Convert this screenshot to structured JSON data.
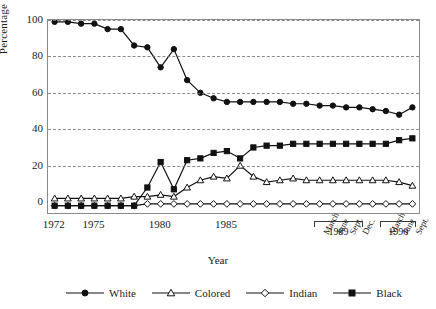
{
  "chart_data": {
    "type": "line",
    "title": "",
    "xlabel": "Year",
    "ylabel": "Percentage",
    "ylim": [
      0,
      100
    ],
    "ytick_values": [
      0,
      20,
      40,
      60,
      80,
      100
    ],
    "ytick_labels": [
      "0",
      "20",
      "40",
      "60",
      "80",
      "100"
    ],
    "grid": true,
    "grid_style": "dashed-horizontal",
    "legend_position": "bottom",
    "x_major_ticks": [
      {
        "label": "1972",
        "index": 0
      },
      {
        "label": "1975",
        "index": 3
      },
      {
        "label": "1980",
        "index": 8
      },
      {
        "label": "1985",
        "index": 13
      }
    ],
    "x_quarter_ticks": [
      {
        "label": "March",
        "index": 20
      },
      {
        "label": "June",
        "index": 21
      },
      {
        "label": "Sept.",
        "index": 22
      },
      {
        "label": "Dec.",
        "index": 23
      },
      {
        "label": "March",
        "index": 25
      },
      {
        "label": "June",
        "index": 26
      },
      {
        "label": "Sept.",
        "index": 27
      }
    ],
    "x_group_brackets": [
      {
        "label": "1989",
        "start_index": 20,
        "end_index": 23
      },
      {
        "label": "1990",
        "start_index": 25,
        "end_index": 27
      }
    ],
    "x": [
      "1972",
      "1973",
      "1974",
      "1975",
      "1976",
      "1977",
      "1978",
      "1979",
      "1980",
      "1981",
      "1982",
      "1983",
      "1984",
      "1985",
      "1986",
      "1987",
      "1988",
      "1988b",
      "1989a",
      "1989b",
      "1989-March",
      "1989-June",
      "1989-Sept.",
      "1989-Dec.",
      "1990a",
      "1990-March",
      "1990-June",
      "1990-Sept."
    ],
    "series": [
      {
        "name": "White",
        "marker": "filled-circle",
        "color": "#111111",
        "values": [
          99,
          99,
          98,
          98,
          95,
          95,
          86,
          85,
          74,
          84,
          67,
          60,
          57,
          55,
          55,
          55,
          55,
          55,
          54,
          54,
          53,
          53,
          52,
          52,
          51,
          50,
          48,
          52
        ]
      },
      {
        "name": "Colored",
        "marker": "open-triangle",
        "color": "#111111",
        "values": [
          2,
          2,
          2,
          2,
          2,
          2,
          3,
          3,
          4,
          3,
          8,
          12,
          14,
          13,
          20,
          14,
          11,
          12,
          13,
          12,
          12,
          12,
          12,
          12,
          12,
          12,
          11,
          9
        ]
      },
      {
        "name": "Indian",
        "marker": "open-diamond",
        "color": "#111111",
        "values": [
          -2,
          -2,
          -2,
          -2,
          -2,
          -2,
          -2,
          -1,
          -1,
          -1,
          -1,
          -1,
          -1,
          -1,
          -1,
          -1,
          -1,
          -1,
          -1,
          -1,
          -1,
          -1,
          -1,
          -1,
          -1,
          -1,
          -1,
          -1
        ]
      },
      {
        "name": "Black",
        "marker": "filled-square",
        "color": "#111111",
        "values": [
          -2,
          -2,
          -2,
          -2,
          -2,
          -2,
          -2,
          8,
          22,
          7,
          23,
          24,
          27,
          28,
          24,
          30,
          31,
          31,
          32,
          32,
          32,
          32,
          32,
          32,
          32,
          32,
          34,
          35
        ]
      }
    ]
  },
  "legend": {
    "items": [
      {
        "label": "White",
        "marker": "filled-circle"
      },
      {
        "label": "Colored",
        "marker": "open-triangle"
      },
      {
        "label": "Indian",
        "marker": "open-diamond"
      },
      {
        "label": "Black",
        "marker": "filled-square"
      }
    ]
  }
}
